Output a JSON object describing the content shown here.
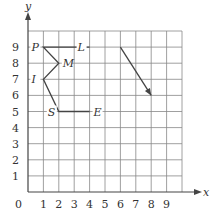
{
  "diagram": {
    "axes": {
      "x_label": "x",
      "y_label": "y",
      "origin_label": "0",
      "x_ticks": [
        "1",
        "2",
        "3",
        "4",
        "5",
        "6",
        "7",
        "8",
        "9"
      ],
      "y_ticks": [
        "1",
        "2",
        "3",
        "4",
        "5",
        "6",
        "7",
        "8",
        "9"
      ],
      "range": [
        0,
        10
      ]
    },
    "points": [
      {
        "name": "P",
        "x": 1,
        "y": 9
      },
      {
        "name": "M",
        "x": 2,
        "y": 8
      },
      {
        "name": "I",
        "x": 1,
        "y": 7
      },
      {
        "name": "S",
        "x": 2,
        "y": 5
      },
      {
        "name": "E",
        "x": 4,
        "y": 5
      },
      {
        "name": "L",
        "x": 4,
        "y": 9
      }
    ],
    "path": [
      "L",
      "P",
      "M",
      "I",
      "S",
      "E"
    ],
    "vector": {
      "from": [
        6,
        9
      ],
      "to": [
        8,
        6
      ]
    },
    "colors": {
      "grid": "#888888",
      "line": "#444444",
      "text": "#333333"
    }
  }
}
